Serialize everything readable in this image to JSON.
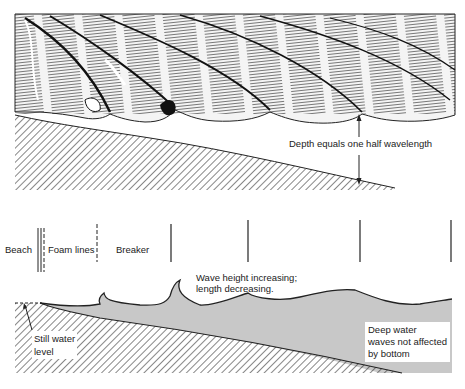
{
  "diagram": {
    "type": "coastal wave profile diagram",
    "top_panel": {
      "description": "Perspective drawing of waves approaching a sloping beach",
      "annotation": "Depth equals one half wavelength"
    },
    "zones": [
      {
        "label": "Beach"
      },
      {
        "label": "Foam lines"
      },
      {
        "label": "Breaker"
      }
    ],
    "bottom_panel": {
      "annotation_middle_line1": "Wave height increasing;",
      "annotation_middle_line2": "length decreasing.",
      "still_water_line1": "Still water",
      "still_water_line2": "level",
      "deep_water_line1": "Deep water",
      "deep_water_line2": "waves not affected",
      "deep_water_line3": "by bottom"
    },
    "colors": {
      "water_fill": "#c8c8c8",
      "line": "#222222",
      "background": "#ffffff"
    }
  }
}
